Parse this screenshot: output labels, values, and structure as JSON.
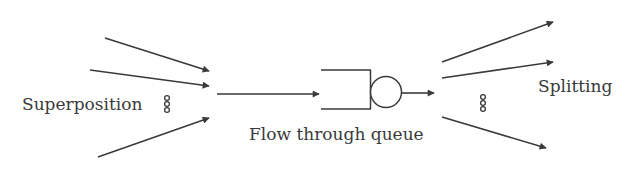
{
  "diagram": {
    "labels": {
      "superposition": "Superposition",
      "splitting": "Splitting",
      "queue": "Flow through queue"
    },
    "colors": {
      "stroke": "#3a3a3a",
      "text": "#3a3a3a",
      "background": "#ffffff"
    },
    "incoming_flows": 3,
    "outgoing_flows": 3,
    "ellipsis_icon": "vertical-dots-icon"
  }
}
